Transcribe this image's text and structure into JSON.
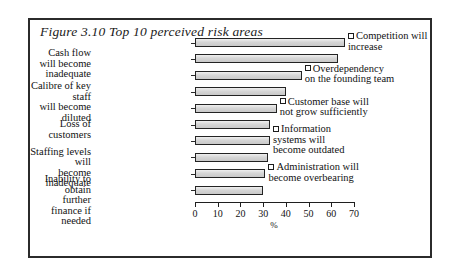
{
  "figure": {
    "title": "Figure 3.10  Top 10 perceived risk areas"
  },
  "axis": {
    "x_title": "%",
    "ticks": [
      "0",
      "10",
      "20",
      "30",
      "40",
      "50",
      "60",
      "70"
    ]
  },
  "chart_data": {
    "type": "bar",
    "orientation": "horizontal",
    "title": "Figure 3.10  Top 10 perceived risk areas",
    "xlabel": "%",
    "ylabel": "",
    "xlim": [
      0,
      70
    ],
    "grid": false,
    "legend": "none",
    "categories": [
      "Competition will increase",
      "Cash flow will become inadequate",
      "Overdependency on the founding team",
      "Calibre of key staff will become diluted",
      "Customer base will not grow sufficiently",
      "Loss of customers",
      "Information systems will become outdated",
      "Staffing levels will become inadequate",
      "Administration will become overbearing",
      "Inability to obtain further finance if needed"
    ],
    "values": [
      66,
      63,
      47,
      40,
      36,
      33,
      33,
      32,
      31,
      30
    ]
  },
  "labels": {
    "left": [
      {
        "text": "Cash flow will become\ninadequate",
        "index": 1
      },
      {
        "text": "Calibre of key staff\nwill become diluted",
        "index": 3
      },
      {
        "text": "Loss of customers",
        "index": 5
      },
      {
        "text": "Staffing levels will\nbecome inadequate",
        "index": 7
      },
      {
        "text": "Inability to obtain\nfurther finance if\nneeded",
        "index": 9
      }
    ],
    "right": [
      {
        "text": "Competition will\nincrease",
        "index": 0
      },
      {
        "text": "Overdependency\non the founding team",
        "index": 2
      },
      {
        "text": "Customer base will\nnot grow sufficiently",
        "index": 4
      },
      {
        "text": "Information\nsystems will\nbecome outdated",
        "index": 6
      },
      {
        "text": "Administration will\nbecome overbearing",
        "index": 8
      }
    ]
  }
}
